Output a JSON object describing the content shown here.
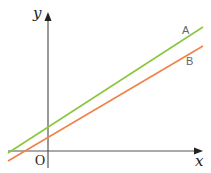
{
  "diagram": {
    "axes": {
      "x_label": "x",
      "y_label": "y",
      "origin_label": "O",
      "color": "#555555"
    },
    "lines": [
      {
        "name": "A",
        "label": "A",
        "color": "#8cc63f",
        "x1": 8,
        "y1": 153,
        "x2": 203,
        "y2": 27
      },
      {
        "name": "B",
        "label": "B",
        "color": "#f0824a",
        "x1": 8,
        "y1": 161,
        "x2": 203,
        "y2": 46
      }
    ]
  }
}
